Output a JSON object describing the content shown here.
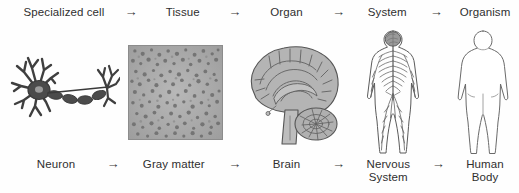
{
  "diagram": {
    "arrow_symbol": "→",
    "top_row": {
      "labels": [
        "Specialized cell",
        "Tissue",
        "Organ",
        "System",
        "Organism"
      ]
    },
    "bottom_row": {
      "labels": [
        "Neuron",
        "Gray matter",
        "Brain",
        "Nervous\nSystem",
        "Human\nBody"
      ]
    },
    "illustrations": [
      {
        "name": "neuron-illustration",
        "caption": "Neuron",
        "style": "line drawing of neuron with dendrites, myelinated axon and axon terminals"
      },
      {
        "name": "gray-matter-illustration",
        "caption": "Gray matter",
        "style": "square micrograph of speckled gray matter tissue"
      },
      {
        "name": "brain-illustration",
        "caption": "Brain",
        "style": "sagittal cross-section of human brain with cerebrum, brainstem and cerebellum"
      },
      {
        "name": "nervous-system-illustration",
        "caption": "Nervous System",
        "style": "body outline with shaded brain and branching nerve network"
      },
      {
        "name": "human-body-illustration",
        "caption": "Human Body",
        "style": "plain human body outline silhouette"
      }
    ],
    "colors": {
      "background": "#fefefe",
      "text": "#2f2f2f",
      "ink": "#4a4a4a",
      "fill_gray": "#a9a9a9",
      "dark_gray": "#5b5b5b"
    }
  }
}
